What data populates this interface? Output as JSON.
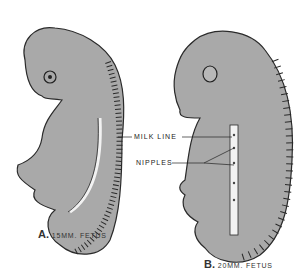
{
  "figure": {
    "colors": {
      "body": "#a9a9a9",
      "outline": "#2a2a2a",
      "milk_line": "#f2f2f2",
      "background": "#ffffff"
    },
    "labels": {
      "milk_line": "MILK LINE",
      "nipples": "NIPPLES"
    },
    "panels": [
      {
        "letter": "A.",
        "caption": "15MM. FETUS"
      },
      {
        "letter": "B.",
        "caption": "20MM. FETUS"
      }
    ]
  }
}
